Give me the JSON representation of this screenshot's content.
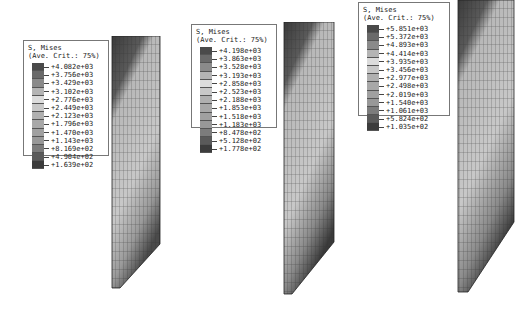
{
  "panels": [
    {
      "legend": {
        "title": "S, Mises",
        "subtitle": "(Ave. Crit.: 75%)",
        "values": [
          "+4.082e+03",
          "+3.756e+03",
          "+3.429e+03",
          "+3.102e+03",
          "+2.776e+03",
          "+2.449e+03",
          "+2.123e+03",
          "+1.796e+03",
          "+1.470e+03",
          "+1.143e+03",
          "+8.169e+02",
          "+4.904e+02",
          "+1.639e+02"
        ]
      }
    },
    {
      "legend": {
        "title": "S, Mises",
        "subtitle": "(Ave. Crit.: 75%)",
        "values": [
          "+4.198e+03",
          "+3.863e+03",
          "+3.528e+03",
          "+3.193e+03",
          "+2.858e+03",
          "+2.523e+03",
          "+2.188e+03",
          "+1.853e+03",
          "+1.518e+03",
          "+1.183e+03",
          "+8.478e+02",
          "+5.128e+02",
          "+1.778e+02"
        ]
      }
    },
    {
      "legend": {
        "title": "S, Mises",
        "subtitle": "(Ave. Crit.: 75%)",
        "values": [
          "+5.851e+03",
          "+5.372e+03",
          "+4.893e+03",
          "+4.414e+03",
          "+3.935e+03",
          "+3.456e+03",
          "+2.977e+03",
          "+2.498e+03",
          "+2.019e+03",
          "+1.540e+03",
          "+1.061e+03",
          "+5.824e+02",
          "+1.035e+02"
        ]
      }
    }
  ],
  "swatch_colors": [
    "#4a4a4a",
    "#6a6a6a",
    "#8a8a8a",
    "#b4b4b4",
    "#dcdcdc",
    "#c8c8c8",
    "#b0b0b0",
    "#a8a8a8",
    "#a0a0a0",
    "#989898",
    "#7c7c7c",
    "#5a5a5a",
    "#3c3c3c"
  ]
}
